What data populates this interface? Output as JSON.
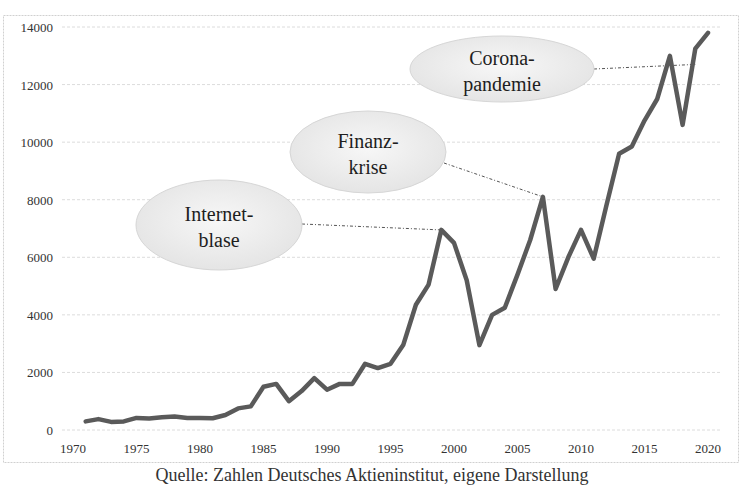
{
  "chart_data": {
    "type": "line",
    "title": "",
    "xlabel": "",
    "ylabel": "",
    "x": [
      1971,
      1972,
      1973,
      1974,
      1975,
      1976,
      1977,
      1978,
      1979,
      1980,
      1981,
      1982,
      1983,
      1984,
      1985,
      1986,
      1987,
      1988,
      1989,
      1990,
      1991,
      1992,
      1993,
      1994,
      1995,
      1996,
      1997,
      1998,
      1999,
      2000,
      2001,
      2002,
      2003,
      2004,
      2005,
      2006,
      2007,
      2008,
      2009,
      2010,
      2011,
      2012,
      2013,
      2014,
      2015,
      2016,
      2017,
      2018,
      2019,
      2020
    ],
    "series": [
      {
        "name": "Index",
        "color": "#5a5a5a",
        "values": [
          300,
          380,
          280,
          300,
          420,
          400,
          440,
          470,
          420,
          420,
          410,
          520,
          750,
          820,
          1500,
          1600,
          1000,
          1350,
          1800,
          1400,
          1600,
          1600,
          2300,
          2150,
          2300,
          2950,
          4350,
          5050,
          6950,
          6500,
          5200,
          2950,
          4000,
          4250,
          5400,
          6600,
          8100,
          4900,
          6000,
          6950,
          5950,
          7800,
          9600,
          9850,
          10750,
          11500,
          13000,
          10600,
          13250,
          13800
        ]
      }
    ],
    "xlim": [
      1970,
      2020
    ],
    "ylim": [
      0,
      14000
    ],
    "xticks": [
      "1970",
      "1975",
      "1980",
      "1985",
      "1990",
      "1995",
      "2000",
      "2005",
      "2010",
      "2015",
      "2020"
    ],
    "yticks": [
      "0",
      "2000",
      "4000",
      "6000",
      "8000",
      "10000",
      "12000",
      "14000"
    ],
    "grid": "horizontal dashed",
    "legend": "none",
    "annotations": [
      {
        "line1": "Internet-",
        "line2": "blase",
        "target_year": 1999,
        "target_value": 6950
      },
      {
        "line1": "Finanz-",
        "line2": "krise",
        "target_year": 2007,
        "target_value": 8100
      },
      {
        "line1": "Corona-",
        "line2": "pandemie",
        "target_year": 2019,
        "target_value": 12700
      }
    ]
  },
  "caption": "Quelle: Zahlen Deutsches Aktieninstitut, eigene Darstellung"
}
